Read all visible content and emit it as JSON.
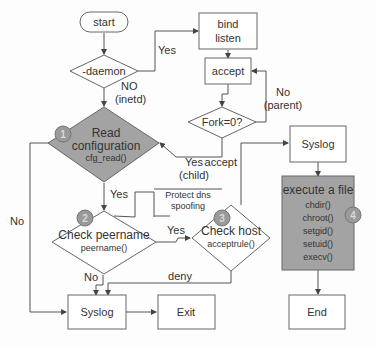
{
  "nodes": {
    "start": "start",
    "daemon": "-daemon",
    "bind": [
      "bind",
      "listen"
    ],
    "accept": "accept",
    "fork": "Fork=0?",
    "read_config": [
      "Read",
      "configuration",
      "cfg_read()"
    ],
    "protect": [
      "Protect dns",
      "spoofing"
    ],
    "check_peer": [
      "Check peername",
      "peername()"
    ],
    "check_host": [
      "Check host",
      "acceptrule()"
    ],
    "syslog_top": "Syslog",
    "execute": [
      "execute a file",
      "chdir()",
      "chroot()",
      "setgid()",
      "setuid()",
      "execv()"
    ],
    "syslog_bottom": "Syslog",
    "exit": "Exit",
    "end": "End"
  },
  "edge_labels": {
    "daemon_yes": "Yes",
    "daemon_no": [
      "NO",
      "(inetd)"
    ],
    "fork_no": [
      "No",
      "(parent)"
    ],
    "fork_yes": [
      "Yes",
      "(child)"
    ],
    "config_yes": "Yes",
    "config_no": "No",
    "peer_yes": "Yes",
    "peer_no": "No",
    "host_accept": "accept",
    "host_deny": "deny"
  },
  "badges": [
    "1",
    "2",
    "3",
    "4"
  ],
  "colors": {
    "gray_fill": "#a3a3a3",
    "stroke": "#666666"
  }
}
